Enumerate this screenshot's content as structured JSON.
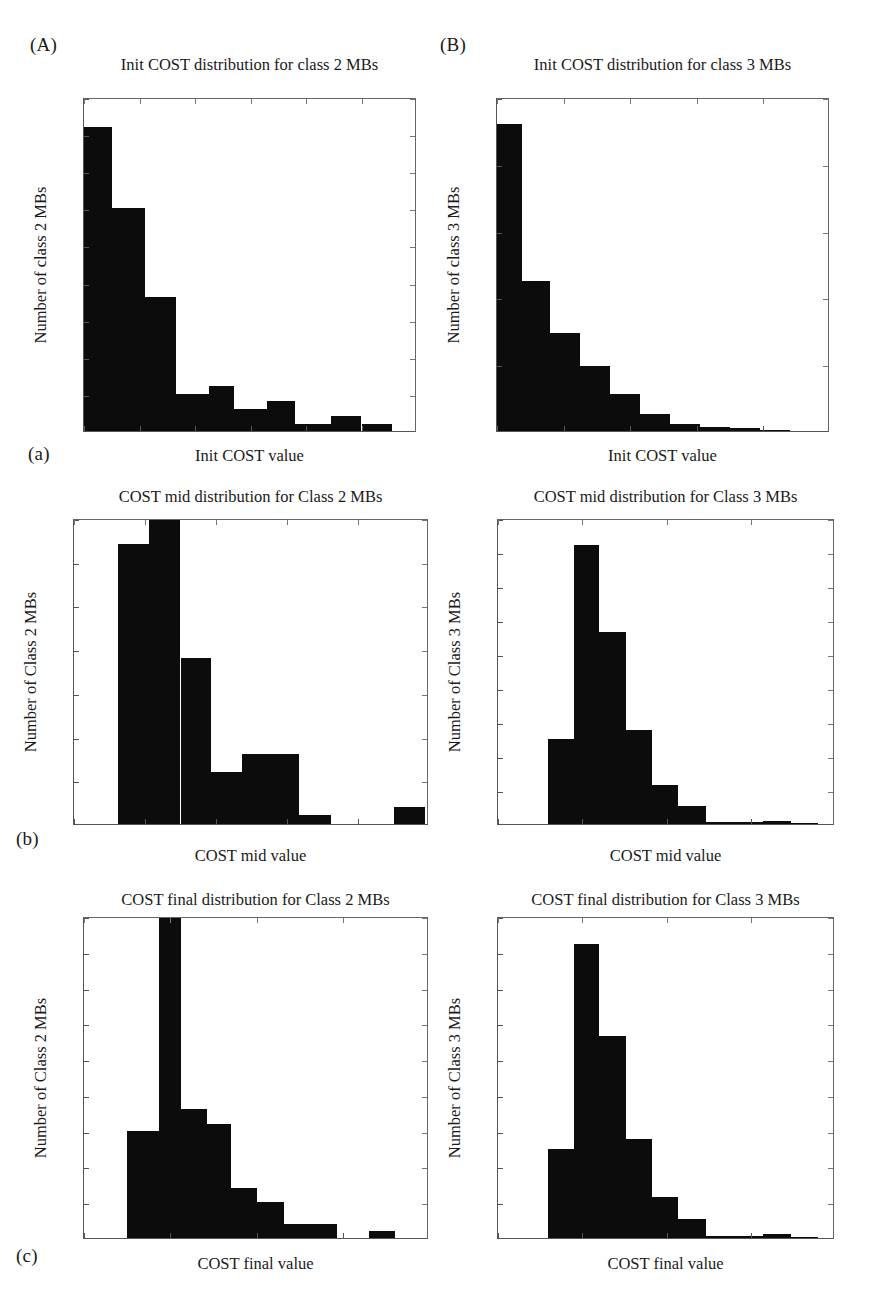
{
  "figure": {
    "panel_labels": [
      {
        "name": "panel-letter-A",
        "text": "(A)"
      },
      {
        "name": "panel-letter-B",
        "text": "(B)"
      },
      {
        "name": "row-letter-a",
        "text": "(a)"
      },
      {
        "name": "row-letter-b",
        "text": "(b)"
      },
      {
        "name": "row-letter-c",
        "text": "(c)"
      }
    ],
    "bar_color": "#0c0c0c",
    "axis_color": "#555555",
    "background": "#ffffff"
  },
  "chart_data": [
    {
      "id": "init-class2",
      "type": "bar",
      "title": "Init COST distribution for class 2 MBs",
      "xlabel": "Init COST value",
      "ylabel": "Number of class 2 MBs",
      "xlim": [
        1000,
        7000
      ],
      "ylim": [
        0,
        45
      ],
      "xticks": [
        1000,
        2000,
        3000,
        4000,
        5000,
        6000,
        7000
      ],
      "yticks": [
        0,
        5,
        10,
        15,
        20,
        25,
        30,
        35,
        40,
        45
      ],
      "grid": false,
      "legend": null,
      "bin_edges": [
        1000,
        1500,
        2100,
        2650,
        3250,
        3700,
        4300,
        4800,
        5450,
        6000,
        6550
      ],
      "values": [
        41,
        30,
        18,
        5,
        6,
        3,
        4,
        1,
        2,
        1
      ]
    },
    {
      "id": "init-class3",
      "type": "bar",
      "title": "Init COST distribution for class 3 MBs",
      "xlabel": "Init COST value",
      "ylabel": "Number of class 3 MBs",
      "xlim": [
        1000,
        6000
      ],
      "ylim": [
        0,
        500
      ],
      "xticks": [
        1000,
        2000,
        3000,
        4000,
        5000,
        6000
      ],
      "yticks": [
        0,
        100,
        200,
        300,
        400,
        500
      ],
      "grid": false,
      "legend": null,
      "bin_edges": [
        1000,
        1380,
        1800,
        2250,
        2700,
        3150,
        3600,
        4050,
        4500,
        4950,
        5400
      ],
      "values": [
        460,
        225,
        147,
        98,
        55,
        25,
        10,
        6,
        5,
        2
      ]
    },
    {
      "id": "mid-class2",
      "type": "bar",
      "title": "COST mid distribution for Class 2 MBs",
      "xlabel": "COST mid value",
      "ylabel": "Number of Class 2 MBs",
      "xlim": [
        0,
        5000
      ],
      "ylim": [
        0,
        35
      ],
      "xticks": [
        0,
        1000,
        2000,
        3000,
        4000,
        5000
      ],
      "yticks": [
        0,
        5,
        10,
        15,
        20,
        25,
        30,
        35
      ],
      "grid": false,
      "legend": null,
      "bin_edges": [
        620,
        1060,
        1500,
        1930,
        2370,
        2810,
        3170,
        3620,
        4500,
        4940
      ],
      "values": [
        32,
        38,
        19,
        6,
        8,
        8,
        1,
        0,
        2
      ]
    },
    {
      "id": "mid-class3",
      "type": "bar",
      "title": "COST mid distribution for Class 3 MBs",
      "xlabel": "COST mid value",
      "ylabel": "Number of Class 3 MBs",
      "xlim": [
        0,
        4000
      ],
      "ylim": [
        0,
        450
      ],
      "xticks": [
        0,
        1000,
        2000,
        3000,
        4000
      ],
      "yticks": [
        0,
        50,
        100,
        150,
        200,
        250,
        300,
        350,
        400,
        450
      ],
      "grid": false,
      "legend": null,
      "bin_edges": [
        590,
        900,
        1200,
        1520,
        1830,
        2140,
        2470,
        3150,
        3480,
        3800
      ],
      "values": [
        125,
        411,
        282,
        138,
        57,
        26,
        3,
        5,
        1
      ]
    },
    {
      "id": "final-class2",
      "type": "bar",
      "title": "COST final distribution for Class 2 MBs",
      "xlabel": "COST final value",
      "ylabel": "Number of Class 2 MBs",
      "xlim": [
        0,
        4000
      ],
      "ylim": [
        0,
        45
      ],
      "xticks": [
        0,
        1000,
        2000,
        3000,
        4000
      ],
      "yticks": [
        0,
        5,
        10,
        15,
        20,
        25,
        30,
        35,
        40,
        45
      ],
      "grid": false,
      "legend": null,
      "bin_edges": [
        500,
        870,
        1120,
        1430,
        1700,
        2010,
        2320,
        2630,
        2930,
        3300,
        3600
      ],
      "values": [
        15,
        48,
        18,
        16,
        7,
        5,
        2,
        2,
        0,
        1
      ]
    },
    {
      "id": "final-class3",
      "type": "bar",
      "title": "COST final distribution for Class 3 MBs",
      "xlabel": "COST final value",
      "ylabel": "Number of Class 3 MBs",
      "xlim": [
        0,
        4000
      ],
      "ylim": [
        0,
        450
      ],
      "xticks": [
        0,
        1000,
        2000,
        3000,
        4000
      ],
      "yticks": [
        0,
        50,
        100,
        150,
        200,
        250,
        300,
        350,
        400,
        450
      ],
      "grid": false,
      "legend": null,
      "bin_edges": [
        590,
        900,
        1200,
        1520,
        1830,
        2140,
        2470,
        3150,
        3480,
        3800
      ],
      "values": [
        125,
        411,
        282,
        138,
        57,
        26,
        3,
        5,
        1
      ]
    }
  ]
}
